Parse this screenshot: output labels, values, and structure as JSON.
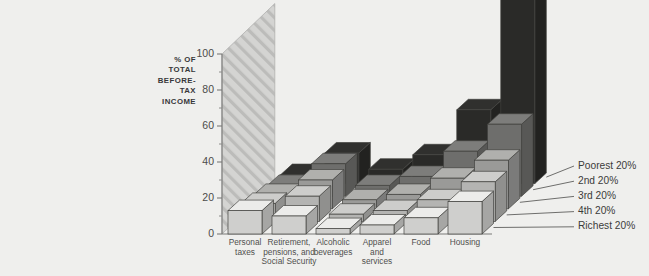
{
  "figure": {
    "background_color": "#efefed",
    "wall_color": "#d3d3d1",
    "wall_hatch_color": "#b9b9b7"
  },
  "axis": {
    "title_lines": [
      "% OF",
      "TOTAL",
      "BEFORE-",
      "TAX",
      "INCOME"
    ],
    "tick_labels": [
      "0",
      "20",
      "40",
      "60",
      "80",
      "100"
    ],
    "tick_values": [
      0,
      20,
      40,
      60,
      80,
      100
    ],
    "minor_tick_values": [
      10,
      30,
      50,
      70,
      90
    ]
  },
  "chart_data": {
    "type": "bar",
    "title": "",
    "xlabel": "",
    "ylabel": "% OF TOTAL BEFORE-TAX INCOME",
    "ylim": [
      0,
      120
    ],
    "grid": false,
    "legend_position": "right-depth-axis",
    "projection": "3d-grouped-bars",
    "categories": [
      "Personal taxes",
      "Retirement, pensions, and Social Security",
      "Alcoholic beverages",
      "Apparel and services",
      "Food",
      "Housing"
    ],
    "category_label_lines": [
      [
        "Personal",
        "taxes"
      ],
      [
        "Retirement,",
        "pensions, and",
        "Social Security"
      ],
      [
        "Alcoholic",
        "beverages"
      ],
      [
        "Apparel",
        "and",
        "services"
      ],
      [
        "Food"
      ],
      [
        "Housing"
      ]
    ],
    "series": [
      {
        "name": "Richest 20%",
        "depth_index": 0,
        "face_color": "#cfcfcd",
        "values": [
          13,
          10,
          3,
          5,
          9,
          18
        ]
      },
      {
        "name": "4th 20%",
        "depth_index": 1,
        "face_color": "#b4b4b2",
        "values": [
          10,
          14,
          4,
          6,
          12,
          22
        ]
      },
      {
        "name": "3rd 20%",
        "depth_index": 2,
        "face_color": "#9a9a98",
        "values": [
          8,
          16,
          5,
          8,
          17,
          27
        ]
      },
      {
        "name": "2nd 20%",
        "depth_index": 3,
        "face_color": "#6e6e6c",
        "values": [
          6,
          18,
          6,
          11,
          25,
          40
        ]
      },
      {
        "name": "Poorest 20%",
        "depth_index": 4,
        "face_color": "#2a2a28",
        "values": [
          5,
          17,
          8,
          16,
          41,
          107
        ]
      }
    ],
    "series_names_back_to_front": [
      "Poorest 20%",
      "2nd 20%",
      "3rd 20%",
      "4th 20%",
      "Richest 20%"
    ]
  }
}
